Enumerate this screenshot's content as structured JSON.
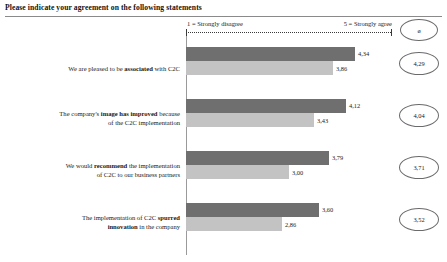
{
  "title": "Please indicate your agreement on the following statements",
  "scale": {
    "left_label": "1 = Strongly disagree",
    "right_label": "5 = Strongly agree",
    "mean_header": "ø"
  },
  "chart_data": {
    "type": "bar",
    "orientation": "horizontal",
    "title": "Please indicate your agreement on the following statements",
    "xlabel": "",
    "ylabel": "",
    "xlim": [
      1,
      5
    ],
    "grid": false,
    "legend_position": "none",
    "decimal_separator": ",",
    "categories": [
      "We are pleased to be associated with C2C",
      "The company's image has improved because of the C2C implementation",
      "We would recommend the implementation of C2C to our business partners",
      "The implementation of C2C spurred innovation in the company"
    ],
    "series": [
      {
        "name": "dark",
        "values": [
          4.34,
          4.12,
          3.79,
          3.6
        ]
      },
      {
        "name": "light",
        "values": [
          3.86,
          3.43,
          3.0,
          2.86
        ]
      }
    ],
    "means": [
      4.29,
      4.04,
      3.71,
      3.52
    ],
    "value_labels": {
      "dark": [
        "4,34",
        "4,12",
        "3,79",
        "3,60"
      ],
      "light": [
        "3,86",
        "3,43",
        "3,00",
        "2,86"
      ]
    },
    "mean_labels": [
      "4,29",
      "4,04",
      "3,71",
      "3,52"
    ]
  },
  "rows": [
    {
      "label_html": "We are pleased to be <b>associated</b> with C2C",
      "dark_label": "4,34",
      "light_label": "3,86",
      "mean_label": "4,29"
    },
    {
      "label_html": "The company's <b>image has improved</b> because<br>of the C2C implementation",
      "dark_label": "4,12",
      "light_label": "3,43",
      "mean_label": "4,04"
    },
    {
      "label_html": "We would <b>recommend</b> the implementation<br>of C2C to our business partners",
      "dark_label": "3,79",
      "light_label": "3,00",
      "mean_label": "3,71"
    },
    {
      "label_html": "The implementation of C2C <b>spurred</b><br><b>innovation</b> in the company",
      "dark_label": "3,60",
      "light_label": "2,86",
      "mean_label": "3,52"
    }
  ]
}
